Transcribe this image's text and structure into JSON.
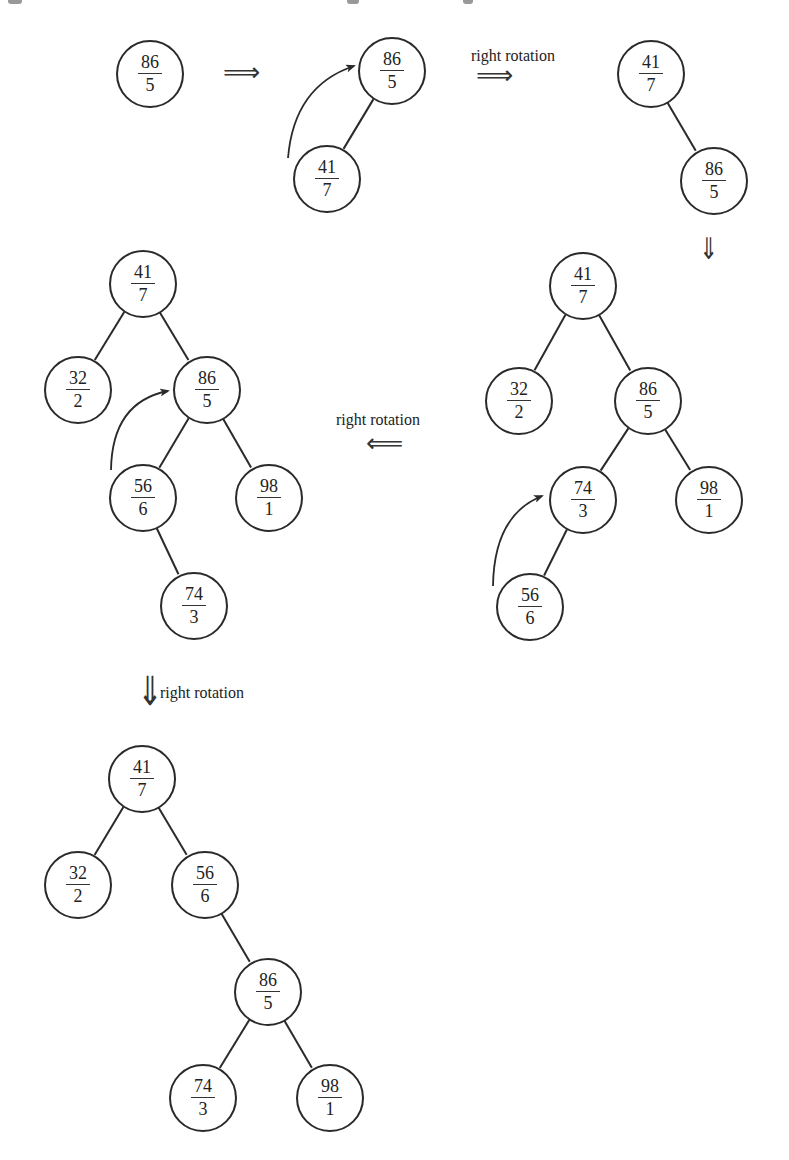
{
  "figure": {
    "colors": {
      "stroke": "#2a2a2a",
      "text": "#222222",
      "background": "#ffffff"
    },
    "top_crop_marks": [
      {
        "x": 8,
        "w": 14
      },
      {
        "x": 347,
        "w": 12
      },
      {
        "x": 463,
        "w": 10
      }
    ],
    "steps": [
      {
        "id": "step1",
        "nodes": [
          {
            "key": "86",
            "priority": "5",
            "x": 149,
            "y": 73
          }
        ],
        "edges": []
      },
      {
        "id": "step2",
        "nodes": [
          {
            "key": "86",
            "priority": "5",
            "x": 391,
            "y": 70
          },
          {
            "key": "41",
            "priority": "7",
            "x": 326,
            "y": 178
          }
        ],
        "edges": [
          [
            0,
            1
          ]
        ],
        "rotation_arc": {
          "from": [
            288,
            158
          ],
          "ctrl": [
            294,
            86
          ],
          "to": [
            354,
            66
          ]
        }
      },
      {
        "id": "step3",
        "nodes": [
          {
            "key": "41",
            "priority": "7",
            "x": 650,
            "y": 73
          },
          {
            "key": "86",
            "priority": "5",
            "x": 713,
            "y": 180
          }
        ],
        "edges": [
          [
            0,
            1
          ]
        ]
      },
      {
        "id": "step4",
        "nodes": [
          {
            "key": "41",
            "priority": "7",
            "x": 582,
            "y": 285
          },
          {
            "key": "32",
            "priority": "2",
            "x": 518,
            "y": 400
          },
          {
            "key": "86",
            "priority": "5",
            "x": 647,
            "y": 400
          },
          {
            "key": "74",
            "priority": "3",
            "x": 582,
            "y": 499
          },
          {
            "key": "98",
            "priority": "1",
            "x": 708,
            "y": 499
          },
          {
            "key": "56",
            "priority": "6",
            "x": 529,
            "y": 606
          }
        ],
        "edges": [
          [
            0,
            1
          ],
          [
            0,
            2
          ],
          [
            2,
            3
          ],
          [
            2,
            4
          ],
          [
            3,
            5
          ]
        ],
        "rotation_arc": {
          "from": [
            493,
            586
          ],
          "ctrl": [
            494,
            515
          ],
          "to": [
            542,
            496
          ]
        }
      },
      {
        "id": "step5",
        "nodes": [
          {
            "key": "41",
            "priority": "7",
            "x": 142,
            "y": 283
          },
          {
            "key": "32",
            "priority": "2",
            "x": 77,
            "y": 389
          },
          {
            "key": "86",
            "priority": "5",
            "x": 206,
            "y": 389
          },
          {
            "key": "56",
            "priority": "6",
            "x": 142,
            "y": 497
          },
          {
            "key": "98",
            "priority": "1",
            "x": 268,
            "y": 497
          },
          {
            "key": "74",
            "priority": "3",
            "x": 193,
            "y": 605
          }
        ],
        "edges": [
          [
            0,
            1
          ],
          [
            0,
            2
          ],
          [
            2,
            3
          ],
          [
            2,
            4
          ],
          [
            3,
            5
          ]
        ],
        "rotation_arc": {
          "from": [
            111,
            470
          ],
          "ctrl": [
            112,
            402
          ],
          "to": [
            168,
            391
          ]
        }
      },
      {
        "id": "step6",
        "nodes": [
          {
            "key": "41",
            "priority": "7",
            "x": 141,
            "y": 778
          },
          {
            "key": "32",
            "priority": "2",
            "x": 77,
            "y": 884
          },
          {
            "key": "56",
            "priority": "6",
            "x": 204,
            "y": 884
          },
          {
            "key": "86",
            "priority": "5",
            "x": 267,
            "y": 991
          },
          {
            "key": "74",
            "priority": "3",
            "x": 202,
            "y": 1097
          },
          {
            "key": "98",
            "priority": "1",
            "x": 329,
            "y": 1097
          }
        ],
        "edges": [
          [
            0,
            1
          ],
          [
            0,
            2
          ],
          [
            2,
            3
          ],
          [
            3,
            4
          ],
          [
            3,
            5
          ]
        ]
      }
    ],
    "transitions": [
      {
        "id": "t1",
        "symbol": "⟹",
        "direction": "right",
        "x": 223,
        "y": 59,
        "size": 26,
        "label": null
      },
      {
        "id": "t2",
        "symbol": "⟹",
        "direction": "right",
        "x": 476,
        "y": 62,
        "size": 26,
        "label": "right rotation",
        "label_x": 471,
        "label_y": 47
      },
      {
        "id": "t3",
        "symbol": "⇓",
        "direction": "down",
        "x": 696,
        "y": 234,
        "size": 30,
        "label": null
      },
      {
        "id": "t4",
        "symbol": "⟸",
        "direction": "left",
        "x": 366,
        "y": 430,
        "size": 26,
        "label": "right rotation",
        "label_x": 336,
        "label_y": 411
      },
      {
        "id": "t5",
        "symbol": "⇓",
        "direction": "down",
        "x": 133,
        "y": 671,
        "size": 40,
        "label": "right rotation",
        "label_x": 160,
        "label_y": 684
      }
    ]
  }
}
